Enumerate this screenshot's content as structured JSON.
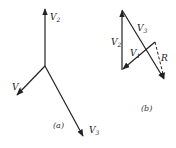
{
  "diagram_a": {
    "caption": "(a)",
    "vectors": [
      {
        "name": "V",
        "sub": "2",
        "from": [
          45,
          66
        ],
        "to": [
          45,
          8
        ]
      },
      {
        "name": "V",
        "sub": "1",
        "from": [
          45,
          66
        ],
        "to": [
          16,
          96
        ]
      },
      {
        "name": "V",
        "sub": "3",
        "from": [
          45,
          66
        ],
        "to": [
          84,
          137
        ]
      }
    ]
  },
  "diagram_b": {
    "caption": "(b)",
    "vectors": [
      {
        "name": "V",
        "sub": "2",
        "from": [
          122,
          70
        ],
        "to": [
          122,
          10
        ]
      },
      {
        "name": "V",
        "sub": "3",
        "from": [
          122,
          10
        ],
        "to": [
          165,
          80
        ]
      },
      {
        "name": "V",
        "sub": "1",
        "from": [
          155,
          42
        ],
        "to": [
          122,
          70
        ]
      }
    ],
    "resultant": {
      "name": "R",
      "from": [
        155,
        42
      ],
      "to": [
        165,
        80
      ],
      "style": "dashed"
    }
  },
  "colors": {
    "stroke": "#222222",
    "background": "#ffffff"
  }
}
